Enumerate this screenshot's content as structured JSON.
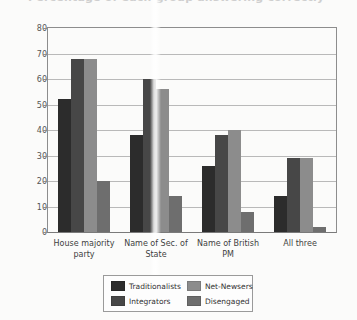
{
  "title_fragment": "Percentage of each group answering correctly",
  "chart_data": {
    "type": "bar",
    "title": "",
    "xlabel": "",
    "ylabel": "",
    "ylim": [
      0,
      80
    ],
    "ytick_step": 10,
    "yticks": [
      "0",
      "10",
      "20",
      "30",
      "40",
      "50",
      "60",
      "70",
      "80"
    ],
    "grid": true,
    "legend_position": "bottom",
    "categories": [
      "House majority party",
      "Name of Sec. of State",
      "Name of British PM",
      "All three"
    ],
    "series": [
      {
        "name": "Traditionalists",
        "color": "#2c2c2c",
        "values": [
          52,
          38,
          26,
          14
        ]
      },
      {
        "name": "Integrators",
        "color": "#474747",
        "values": [
          68,
          60,
          38,
          29
        ]
      },
      {
        "name": "Net-Newsers",
        "color": "#8c8c8c",
        "values": [
          68,
          56,
          40,
          29
        ]
      },
      {
        "name": "Disengaged",
        "color": "#6e6e6e",
        "values": [
          20,
          14,
          8,
          2
        ]
      }
    ]
  },
  "legend": {
    "items": [
      {
        "label": "Traditionalists",
        "color": "#2c2c2c"
      },
      {
        "label": "Net-Newsers",
        "color": "#8c8c8c"
      },
      {
        "label": "Integrators",
        "color": "#474747"
      },
      {
        "label": "Disengaged",
        "color": "#6e6e6e"
      }
    ]
  }
}
